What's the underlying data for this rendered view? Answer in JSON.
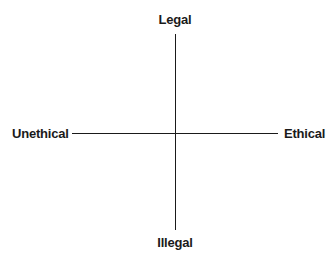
{
  "diagram": {
    "type": "quadrant-axes",
    "axes": {
      "vertical": {
        "top_label": "Legal",
        "bottom_label": "Illegal"
      },
      "horizontal": {
        "left_label": "Unethical",
        "right_label": "Ethical"
      }
    },
    "colors": {
      "line": "#1a1a1a",
      "text": "#1a1a1a",
      "background": "#ffffff"
    }
  }
}
